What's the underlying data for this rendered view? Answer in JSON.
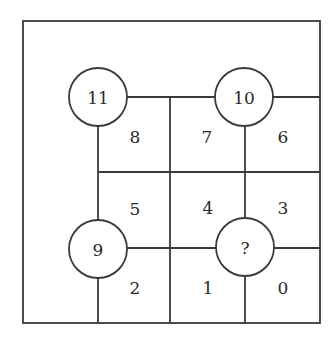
{
  "diagram": {
    "type": "number-grid-puzzle",
    "circles": [
      {
        "id": "top-left",
        "label": "11"
      },
      {
        "id": "top-right",
        "label": "10"
      },
      {
        "id": "bottom-left",
        "label": "9"
      },
      {
        "id": "bottom-right",
        "label": "?"
      }
    ],
    "cells": [
      {
        "id": "r1c1",
        "label": "8"
      },
      {
        "id": "r1c2",
        "label": "7"
      },
      {
        "id": "r1c3",
        "label": "6"
      },
      {
        "id": "r2c1",
        "label": "5"
      },
      {
        "id": "r2c2",
        "label": "4"
      },
      {
        "id": "r2c3",
        "label": "3"
      },
      {
        "id": "r3c1",
        "label": "2"
      },
      {
        "id": "r3c2",
        "label": "1"
      },
      {
        "id": "r3c3",
        "label": "0"
      }
    ]
  }
}
